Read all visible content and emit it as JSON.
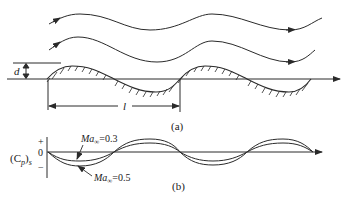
{
  "figure_a": {
    "caption": "(a)",
    "amplitude_label": "d",
    "wavelength_label": "l",
    "streamlines": 2
  },
  "figure_b": {
    "caption": "(b)",
    "y_label_main": "(C",
    "y_label_sub1": "p",
    "y_label_close": ")",
    "y_label_sub2": "s",
    "tick_plus": "+",
    "tick_zero": "0",
    "tick_minus": "−",
    "curves": [
      {
        "label_prefix": "Ma",
        "label_sub": "∞",
        "label_value": "=0.3"
      },
      {
        "label_prefix": "Ma",
        "label_sub": "∞",
        "label_value": "=0.5"
      }
    ]
  },
  "colors": {
    "line": "#2a2a2a",
    "background": "#ffffff"
  }
}
